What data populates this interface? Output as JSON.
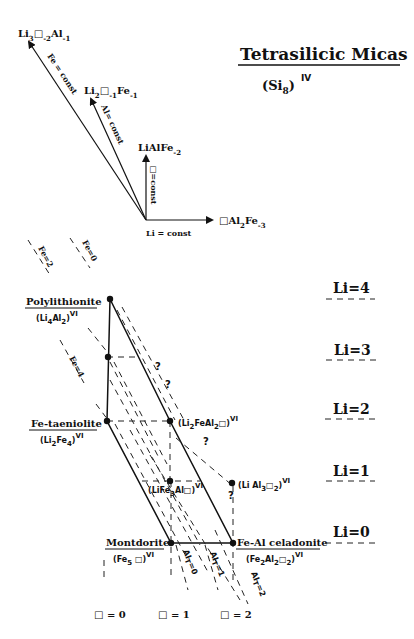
{
  "title": {
    "main": "Tetrasilicic Micas",
    "subtitle_base": "(Si",
    "subtitle_sub": "8",
    "subtitle_close": ")",
    "subtitle_sup": "IV"
  },
  "vector_diagram": {
    "origin_label": "Li = const",
    "vectors": [
      {
        "id": "v1",
        "head": "Li",
        "sub1": "3",
        "mid": "□",
        "sub2": "-2",
        "tail": "Al",
        "sub3": "-1",
        "line_label": "Fe = const"
      },
      {
        "id": "v2",
        "head": "Li",
        "sub1": "2",
        "mid": "□",
        "sub2": "-1",
        "tail": "Fe",
        "sub3": "-1",
        "line_label": "Al= const"
      },
      {
        "id": "v3",
        "head": "LiAlFe",
        "sub1": "-2",
        "line_label": "□=const"
      },
      {
        "id": "v4",
        "head": "□Al",
        "sub1": "2",
        "tail": "Fe",
        "sub2": "-3"
      }
    ]
  },
  "minerals": {
    "polylithionite": {
      "name": "Polylithionite",
      "f1": "(Li",
      "s1": "4",
      "f2": "Al",
      "s2": "2",
      "f3": ")",
      "sup": "VI"
    },
    "fe_taeniolite": {
      "name": "Fe-taeniolite",
      "f1": "(Li",
      "s1": "2",
      "f2": "Fe",
      "s2": "4",
      "f3": ")",
      "sup": "VI"
    },
    "montdorite": {
      "name": "Montdorite",
      "f1": "(Fe",
      "s1": "5",
      "f2": " □)",
      "sup": "VI"
    },
    "fe_al_celadonite": {
      "name": "Fe-Al celadonite",
      "f1": "(Fe",
      "s1": "2",
      "f2": "Al",
      "s2": "2",
      "f3": "□",
      "s3": "2",
      "f4": ")",
      "sup": "VI"
    },
    "li2feal2": {
      "f1": "(Li",
      "s1": "2",
      "f2": "FeAl",
      "s2": "2",
      "f3": "□)",
      "sup": "VI"
    },
    "life3al": {
      "f1": "(LiFe",
      "s1": "3",
      "f2": "Al□)",
      "sup": "VI"
    },
    "lial3": {
      "f1": "(Li Al",
      "s1": "3",
      "f2": "□",
      "s2": "2",
      "f3": ")",
      "sup": "VI"
    }
  },
  "li_levels": [
    "Li=4",
    "Li=3",
    "Li=2",
    "Li=1",
    "Li=0"
  ],
  "fe_lines": [
    "Fe=2",
    "Fe=0",
    "Fe=4"
  ],
  "vacancy_labels": [
    "□ = 0",
    "□ = 1",
    "□ = 2"
  ],
  "al_t_labels": [
    {
      "base": "Al",
      "sub": "T",
      "eq": "=0"
    },
    {
      "base": "Al",
      "sub": "T",
      "eq": "=1"
    },
    {
      "base": "Al",
      "sub": "T",
      "eq": "=2"
    }
  ],
  "question_mark": "?"
}
